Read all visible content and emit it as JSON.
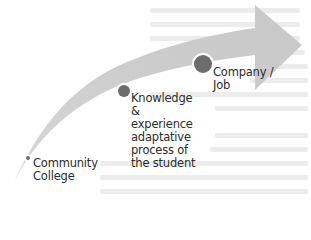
{
  "diagram": {
    "type": "curved-progress-arrow",
    "colors": {
      "arrow_fill": "#cfcfcf",
      "arrow_fill_light": "#e6e6e6",
      "node_fill": "#6d6d6d",
      "node_border": "#ffffff",
      "text": "#2b2b2b",
      "background": "#ffffff"
    },
    "nodes": [
      {
        "id": "community-college",
        "lines": [
          "Community",
          "College"
        ]
      },
      {
        "id": "knowledge",
        "lines": [
          "Knowledge",
          "&",
          "experience",
          "adaptative",
          "process of",
          "the student"
        ]
      },
      {
        "id": "company-job",
        "lines": [
          "Company /",
          "Job"
        ]
      }
    ]
  }
}
